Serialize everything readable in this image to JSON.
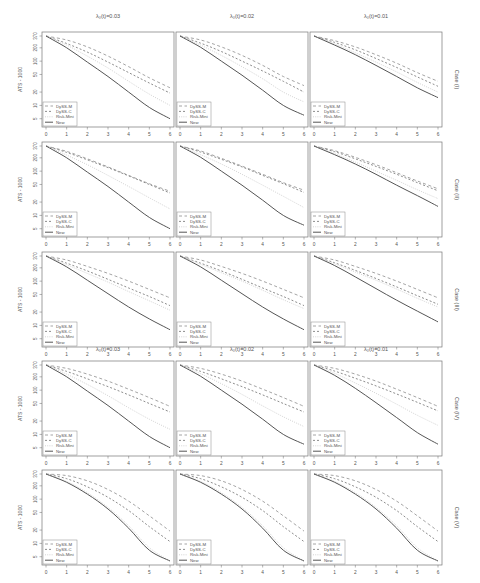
{
  "chart_data": {
    "type": "line",
    "layout": {
      "rows": 5,
      "cols": 3,
      "legend_position": "bottom-left",
      "grid": false,
      "y_scale": "log"
    },
    "xlabel": "",
    "ylabel": "ATS - 1000",
    "xlim": [
      0,
      6
    ],
    "ylim": [
      4,
      370
    ],
    "x_ticks": [
      "0",
      "1",
      "2",
      "3",
      "4",
      "5",
      "6"
    ],
    "y_ticks": [
      "370",
      "200",
      "100",
      "50",
      "20",
      "10",
      "5"
    ],
    "y_tick_values": [
      370,
      200,
      100,
      50,
      20,
      10,
      5
    ],
    "column_titles": [
      "λ₀(t)=0.03",
      "λ₀(t)=0.02",
      "λ₀(t)=0.01"
    ],
    "row_titles": [
      "Case (I)",
      "Case (II)",
      "Case (III)",
      "Case (IV)",
      "Case (V)"
    ],
    "legend": [
      "DySS-M",
      "DySS-C",
      "Risk-Mini",
      "New"
    ],
    "x": [
      0,
      1,
      2,
      3,
      4,
      5,
      6
    ],
    "panels": [
      {
        "row": 0,
        "col": 0,
        "series": [
          {
            "name": "DySS-M",
            "values": [
              370,
              300,
              210,
              130,
              75,
              42,
              25
            ]
          },
          {
            "name": "DySS-C",
            "values": [
              370,
              250,
              160,
              95,
              55,
              32,
              19
            ]
          },
          {
            "name": "Risk-Mini",
            "values": [
              370,
              230,
              130,
              70,
              35,
              18,
              10
            ]
          },
          {
            "name": "New",
            "values": [
              370,
              200,
              95,
              45,
              20,
              9,
              5
            ]
          }
        ]
      },
      {
        "row": 0,
        "col": 1,
        "series": [
          {
            "name": "DySS-M",
            "values": [
              370,
              300,
              210,
              135,
              80,
              45,
              28
            ]
          },
          {
            "name": "DySS-C",
            "values": [
              370,
              255,
              165,
              100,
              60,
              35,
              20
            ]
          },
          {
            "name": "Risk-Mini",
            "values": [
              370,
              230,
              135,
              75,
              40,
              20,
              12
            ]
          },
          {
            "name": "New",
            "values": [
              370,
              205,
              100,
              48,
              22,
              10,
              6
            ]
          }
        ]
      },
      {
        "row": 0,
        "col": 2,
        "series": [
          {
            "name": "DySS-M",
            "values": [
              370,
              290,
              210,
              140,
              90,
              55,
              35
            ]
          },
          {
            "name": "DySS-C",
            "values": [
              370,
              265,
              180,
              115,
              72,
              44,
              27
            ]
          },
          {
            "name": "Risk-Mini",
            "values": [
              370,
              245,
              155,
              95,
              57,
              33,
              20
            ]
          },
          {
            "name": "New",
            "values": [
              370,
              230,
              140,
              80,
              45,
              25,
              15
            ]
          }
        ]
      },
      {
        "row": 1,
        "col": 0,
        "series": [
          {
            "name": "DySS-M",
            "values": [
              370,
              280,
              190,
              125,
              80,
              52,
              35
            ]
          },
          {
            "name": "DySS-C",
            "values": [
              370,
              265,
              180,
              120,
              78,
              50,
              32
            ]
          },
          {
            "name": "Risk-Mini",
            "values": [
              370,
              230,
              140,
              80,
              45,
              25,
              14
            ]
          },
          {
            "name": "New",
            "values": [
              370,
              200,
              95,
              45,
              20,
              9,
              5
            ]
          }
        ]
      },
      {
        "row": 1,
        "col": 1,
        "series": [
          {
            "name": "DySS-M",
            "values": [
              370,
              285,
              195,
              130,
              85,
              55,
              37
            ]
          },
          {
            "name": "DySS-C",
            "values": [
              370,
              270,
              185,
              125,
              80,
              52,
              33
            ]
          },
          {
            "name": "Risk-Mini",
            "values": [
              370,
              235,
              145,
              85,
              48,
              27,
              15
            ]
          },
          {
            "name": "New",
            "values": [
              370,
              205,
              100,
              48,
              22,
              10,
              6
            ]
          }
        ]
      },
      {
        "row": 1,
        "col": 2,
        "series": [
          {
            "name": "DySS-M",
            "values": [
              370,
              290,
              205,
              140,
              92,
              60,
              40
            ]
          },
          {
            "name": "DySS-C",
            "values": [
              370,
              275,
              190,
              128,
              85,
              55,
              36
            ]
          },
          {
            "name": "Risk-Mini",
            "values": [
              370,
              250,
              160,
              100,
              62,
              38,
              24
            ]
          },
          {
            "name": "New",
            "values": [
              370,
              235,
              145,
              85,
              48,
              28,
              16
            ]
          }
        ]
      },
      {
        "row": 2,
        "col": 0,
        "series": [
          {
            "name": "DySS-M",
            "values": [
              370,
              300,
              215,
              150,
              100,
              65,
              42
            ]
          },
          {
            "name": "DySS-C",
            "values": [
              370,
              255,
              170,
              110,
              70,
              45,
              28
            ]
          },
          {
            "name": "Risk-Mini",
            "values": [
              370,
              235,
              150,
              95,
              58,
              36,
              22
            ]
          },
          {
            "name": "New",
            "values": [
              370,
              210,
              105,
              52,
              26,
              14,
              8
            ]
          }
        ]
      },
      {
        "row": 2,
        "col": 1,
        "series": [
          {
            "name": "DySS-M",
            "values": [
              370,
              300,
              215,
              150,
              100,
              65,
              42
            ]
          },
          {
            "name": "DySS-C",
            "values": [
              370,
              255,
              170,
              110,
              70,
              45,
              28
            ]
          },
          {
            "name": "Risk-Mini",
            "values": [
              370,
              240,
              155,
              100,
              62,
              38,
              24
            ]
          },
          {
            "name": "New",
            "values": [
              370,
              210,
              105,
              52,
              26,
              14,
              8
            ]
          }
        ]
      },
      {
        "row": 2,
        "col": 2,
        "series": [
          {
            "name": "DySS-M",
            "values": [
              370,
              300,
              215,
              150,
              100,
              65,
              42
            ]
          },
          {
            "name": "DySS-C",
            "values": [
              370,
              260,
              175,
              115,
              74,
              47,
              30
            ]
          },
          {
            "name": "Risk-Mini",
            "values": [
              370,
              245,
              160,
              105,
              66,
              41,
              26
            ]
          },
          {
            "name": "New",
            "values": [
              370,
              225,
              125,
              68,
              37,
              21,
              12
            ]
          }
        ]
      },
      {
        "row": 3,
        "col": 0,
        "series": [
          {
            "name": "DySS-M",
            "values": [
              370,
              310,
              230,
              160,
              105,
              68,
              43
            ]
          },
          {
            "name": "DySS-C",
            "values": [
              370,
              265,
              180,
              120,
              78,
              50,
              32
            ]
          },
          {
            "name": "Risk-Mini",
            "values": [
              370,
              230,
              135,
              75,
              40,
              22,
              13
            ]
          },
          {
            "name": "New",
            "values": [
              370,
              200,
              95,
              45,
              20,
              9,
              5
            ]
          }
        ]
      },
      {
        "row": 3,
        "col": 1,
        "series": [
          {
            "name": "DySS-M",
            "values": [
              370,
              310,
              230,
              160,
              105,
              68,
              43
            ]
          },
          {
            "name": "DySS-C",
            "values": [
              370,
              265,
              180,
              120,
              78,
              50,
              32
            ]
          },
          {
            "name": "Risk-Mini",
            "values": [
              370,
              235,
              140,
              80,
              44,
              25,
              15
            ]
          },
          {
            "name": "New",
            "values": [
              370,
              205,
              100,
              48,
              22,
              10,
              6
            ]
          }
        ]
      },
      {
        "row": 3,
        "col": 2,
        "series": [
          {
            "name": "DySS-M",
            "values": [
              370,
              310,
              230,
              160,
              105,
              68,
              43
            ]
          },
          {
            "name": "DySS-C",
            "values": [
              370,
              270,
              185,
              125,
              82,
              53,
              34
            ]
          },
          {
            "name": "Risk-Mini",
            "values": [
              370,
              240,
              145,
              85,
              48,
              27,
              16
            ]
          },
          {
            "name": "New",
            "values": [
              370,
              215,
              110,
              52,
              24,
              11,
              6
            ]
          }
        ]
      },
      {
        "row": 4,
        "col": 0,
        "series": [
          {
            "name": "DySS-M",
            "values": [
              370,
              340,
              260,
              165,
              90,
              42,
              19
            ]
          },
          {
            "name": "DySS-C",
            "values": [
              370,
              290,
              190,
              110,
              55,
              24,
              11
            ]
          },
          {
            "name": "Risk-Mini",
            "values": [
              370,
              250,
              140,
              65,
              25,
              8,
              4
            ]
          },
          {
            "name": "New",
            "values": [
              370,
              240,
              130,
              60,
              22,
              7,
              4
            ]
          }
        ]
      },
      {
        "row": 4,
        "col": 1,
        "series": [
          {
            "name": "DySS-M",
            "values": [
              370,
              340,
              260,
              165,
              90,
              42,
              19
            ]
          },
          {
            "name": "DySS-C",
            "values": [
              370,
              290,
              190,
              110,
              55,
              24,
              11
            ]
          },
          {
            "name": "Risk-Mini",
            "values": [
              370,
              250,
              140,
              65,
              25,
              8,
              4
            ]
          },
          {
            "name": "New",
            "values": [
              370,
              240,
              130,
              60,
              22,
              7,
              4
            ]
          }
        ]
      },
      {
        "row": 4,
        "col": 2,
        "series": [
          {
            "name": "DySS-M",
            "values": [
              370,
              340,
              260,
              165,
              90,
              42,
              19
            ]
          },
          {
            "name": "DySS-C",
            "values": [
              370,
              290,
              190,
              110,
              55,
              24,
              11
            ]
          },
          {
            "name": "Risk-Mini",
            "values": [
              370,
              250,
              140,
              65,
              25,
              8,
              4
            ]
          },
          {
            "name": "New",
            "values": [
              370,
              240,
              130,
              60,
              22,
              7,
              4
            ]
          }
        ]
      }
    ],
    "styles": {
      "DySS-M": {
        "color": "#9a9a9a",
        "dash": "3,2.5",
        "width": 0.9
      },
      "DySS-C": {
        "color": "#808080",
        "dash": "2,2",
        "width": 0.9
      },
      "Risk-Mini": {
        "color": "#cfcfcf",
        "dash": "1,1.2",
        "width": 0.9
      },
      "New": {
        "color": "#555555",
        "dash": "",
        "width": 1.0
      }
    },
    "extra_column_titles_row": 3
  },
  "colors": {
    "axis": "#6a6a6a",
    "text": "#555555",
    "frame": "#777777",
    "legend_border": "#888888"
  }
}
